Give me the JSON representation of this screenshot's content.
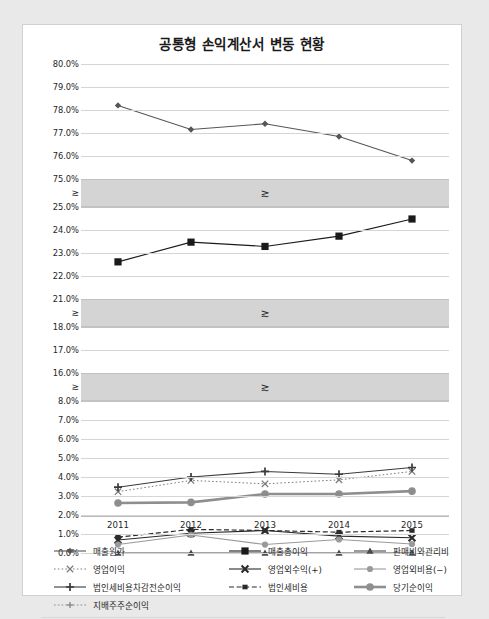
{
  "card": {
    "title": "공통형 손익계산서 변동 현황"
  },
  "chart_data": {
    "type": "line",
    "title": "공통형 손익계산서 변동 현황",
    "xlabel": "",
    "ylabel": "",
    "categories": [
      "2011",
      "2012",
      "2013",
      "2014",
      "2015"
    ],
    "x": [
      2011,
      2012,
      2013,
      2014,
      2015
    ],
    "grid": true,
    "legend_position": "bottom",
    "value_format": "percent",
    "y_axis": {
      "ticks": [
        "80.0%",
        "79.0%",
        "78.0%",
        "77.0%",
        "76.0%",
        "75.0%",
        "25.0%",
        "24.0%",
        "23.0%",
        "22.0%",
        "21.0%",
        "18.0%",
        "17.0%",
        "16.0%",
        "8.0%",
        "7.0%",
        "6.0%",
        "5.0%",
        "4.0%",
        "3.0%",
        "2.0%",
        "1.0%",
        "0.0%"
      ],
      "breaks": [
        {
          "from": "75.0%",
          "to": "25.0%",
          "marker": "≳"
        },
        {
          "from": "21.0%",
          "to": "18.0%",
          "marker": "≳"
        },
        {
          "from": "16.0%",
          "to": "8.0%",
          "marker": "≳"
        }
      ]
    },
    "series": [
      {
        "name": "매출원가",
        "marker": "diamond",
        "line": "solid",
        "color": "#555555",
        "values": [
          78.2,
          77.15,
          77.4,
          76.85,
          75.8
        ]
      },
      {
        "name": "매출총이익",
        "marker": "square",
        "line": "solid",
        "color": "#1a1a1a",
        "values": [
          21.8,
          22.95,
          22.7,
          23.3,
          24.3
        ]
      },
      {
        "name": "판매비와관리비",
        "marker": "triangle",
        "line": "solid",
        "color": "#4a4a4a",
        "values": [
          16.35,
          16.4,
          16.45,
          16.8,
          17.15
        ]
      },
      {
        "name": "영업이익",
        "marker": "x",
        "line": "dotted",
        "color": "#7d7d7d",
        "values": [
          5.45,
          6.45,
          6.15,
          6.5,
          7.25
        ]
      },
      {
        "name": "영업외수익(+)",
        "marker": "x-bold",
        "line": "solid",
        "color": "#2a2a2a",
        "values": [
          1.15,
          1.75,
          2.0,
          1.5,
          1.35
        ]
      },
      {
        "name": "영업외비용(−)",
        "marker": "circle",
        "line": "solid",
        "color": "#9a9a9a",
        "values": [
          0.75,
          1.6,
          0.75,
          1.2,
          0.8
        ]
      },
      {
        "name": "법인세비용차감전순이익",
        "marker": "plus",
        "line": "solid",
        "color": "#3a3a3a",
        "values": [
          5.85,
          6.75,
          7.25,
          7.0,
          7.6
        ]
      },
      {
        "name": "법인세비용",
        "marker": "square-small",
        "line": "dashed",
        "color": "#2b2b2b",
        "values": [
          1.4,
          2.1,
          2.0,
          1.85,
          2.0
        ]
      },
      {
        "name": "당기순이익",
        "marker": "circle-big",
        "line": "thick",
        "color": "#8f8f8f",
        "values": [
          4.45,
          4.5,
          5.25,
          5.25,
          5.5
        ]
      },
      {
        "name": "지배주주순이익",
        "marker": "plus-small",
        "line": "dotted",
        "color": "#8c8c8c",
        "values": [
          4.45,
          4.5,
          5.25,
          5.25,
          5.5
        ]
      }
    ]
  },
  "legend": {
    "rows": [
      [
        {
          "label": "매출원가",
          "key": "s0"
        },
        {
          "label": "매출총이익",
          "key": "s1"
        },
        {
          "label": "판매비와관리비",
          "key": "s2"
        }
      ],
      [
        {
          "label": "영업이익",
          "key": "s3"
        },
        {
          "label": "영업외수익(+)",
          "key": "s4"
        },
        {
          "label": "영업외비용(−)",
          "key": "s5"
        }
      ],
      [
        {
          "label": "법인세비용차감전순이익",
          "key": "s6"
        },
        {
          "label": "법인세비용",
          "key": "s7"
        },
        {
          "label": "당기순이익",
          "key": "s8"
        }
      ],
      [
        {
          "label": "지배주주순이익",
          "key": "s9"
        }
      ]
    ]
  }
}
